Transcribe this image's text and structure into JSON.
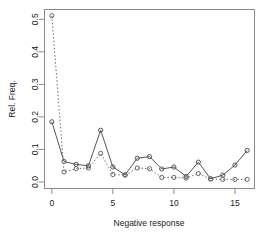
{
  "chart_data": {
    "type": "line",
    "title": "",
    "subtitle": "",
    "xlabel": "Negative response",
    "ylabel": "Rel. Freq.",
    "xlim": [
      -0.6,
      16.6
    ],
    "ylim": [
      -0.02,
      0.53
    ],
    "xticks": [
      0,
      5,
      10,
      15
    ],
    "xticklabels": [
      "0",
      "5",
      "10",
      "15"
    ],
    "yticks": [
      0.0,
      0.1,
      0.2,
      0.3,
      0.4,
      0.5
    ],
    "yticklabels": [
      "0.0",
      "0.1",
      "0.2",
      "0.3",
      "0.4",
      "0.5"
    ],
    "grid": false,
    "legend": "none",
    "x": [
      0,
      1,
      2,
      3,
      4,
      5,
      6,
      7,
      8,
      9,
      10,
      11,
      12,
      13,
      14,
      15,
      16
    ],
    "series": [
      {
        "name": "observed",
        "linestyle": "solid",
        "marker": "circle",
        "color": "#555555",
        "values": [
          0.185,
          0.063,
          0.054,
          0.05,
          0.159,
          0.046,
          0.022,
          0.073,
          0.078,
          0.04,
          0.046,
          0.017,
          0.061,
          0.01,
          0.021,
          0.052,
          0.097
        ]
      },
      {
        "name": "fitted",
        "linestyle": "dotted",
        "marker": "circle",
        "color": "#666666",
        "values": [
          0.511,
          0.031,
          0.041,
          0.043,
          0.088,
          0.023,
          0.021,
          0.043,
          0.041,
          0.014,
          0.014,
          0.012,
          0.026,
          0.009,
          0.008,
          0.008,
          0.008
        ]
      }
    ]
  },
  "axes": {
    "x_label": "Negative response",
    "y_label": "Rel. Freq."
  }
}
